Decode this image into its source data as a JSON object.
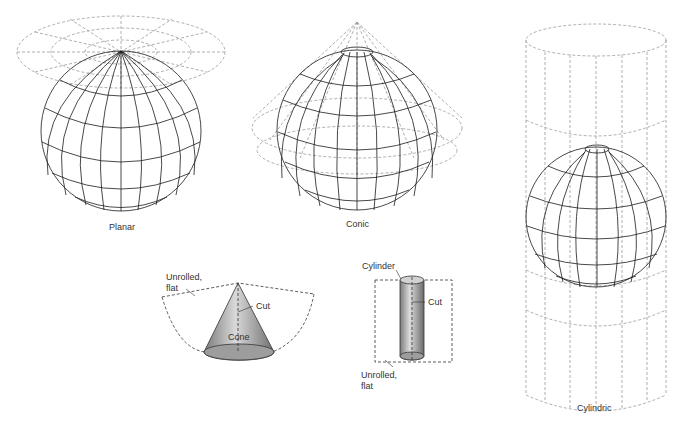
{
  "figure": {
    "panels": [
      {
        "id": "planar",
        "caption": "Planar"
      },
      {
        "id": "conic",
        "caption": "Conic"
      },
      {
        "id": "cylindric",
        "caption": "Cylindric"
      }
    ],
    "cone_detail": {
      "unrolled_label": "Unrolled,",
      "unrolled_label_2": "flat",
      "cut_label": "Cut",
      "shape_label": "Cone"
    },
    "cylinder_detail": {
      "shape_label": "Cylinder",
      "cut_label": "Cut",
      "unrolled_label": "Unrolled,",
      "unrolled_label_2": "flat"
    },
    "colors": {
      "grid_line": "#1a1a1a",
      "projection_dashed": "#9a9a9a",
      "surface_fill": "#a8a8a8",
      "background": "#ffffff"
    }
  }
}
